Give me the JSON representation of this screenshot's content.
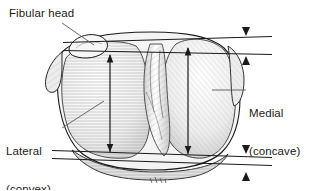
{
  "figure": {
    "style": "medical-line-drawing",
    "background_color": "#ffffff",
    "ink_color": "#1a1a1a",
    "shading_color": "#9a9a9a"
  },
  "labels": {
    "fibular_head": "Fibular head",
    "lateral_line1": "Lateral",
    "lateral_line2": "(convex)",
    "medial_line1": "Medial",
    "medial_line2": "(concave)"
  },
  "annotations": {
    "vertical_measure_lateral": "lateral-plateau-depth-arrow",
    "vertical_measure_medial": "medial-plateau-depth-arrow",
    "caliper_top": "top-reference-line-pair",
    "caliper_bottom": "bottom-reference-line-pair",
    "arrowhead_top_upper": "down-arrowhead",
    "arrowhead_top_lower": "up-arrowhead",
    "arrowhead_bottom_upper": "down-arrowhead",
    "arrowhead_bottom_lower": "up-arrowhead"
  }
}
